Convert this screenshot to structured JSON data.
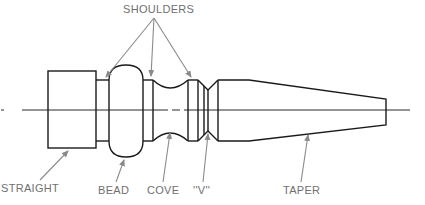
{
  "diagram": {
    "colors": {
      "outline": "#1a1a1a",
      "arrow": "#8a8a8a",
      "label": "#6f6f6f",
      "background": "#ffffff"
    },
    "labels": {
      "shoulders": "SHOULDERS",
      "straight": "STRAIGHT",
      "bead": "BEAD",
      "cove": "COVE",
      "v": "''V''",
      "taper": "TAPER"
    },
    "parts": [
      {
        "name": "straight",
        "label": "STRAIGHT"
      },
      {
        "name": "shoulder-1",
        "label": "SHOULDERS"
      },
      {
        "name": "bead",
        "label": "BEAD"
      },
      {
        "name": "shoulder-2",
        "label": "SHOULDERS"
      },
      {
        "name": "cove",
        "label": "COVE"
      },
      {
        "name": "shoulder-3",
        "label": "SHOULDERS"
      },
      {
        "name": "v-groove",
        "label": "''V''"
      },
      {
        "name": "taper",
        "label": "TAPER"
      }
    ]
  }
}
